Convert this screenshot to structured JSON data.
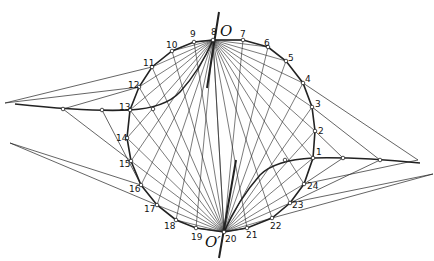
{
  "diagram": {
    "labels": {
      "top_pole": "O",
      "bottom_pole": "O′"
    },
    "points": [
      {
        "n": "1",
        "x": 313,
        "y": 158,
        "lx": 316,
        "ly": 155
      },
      {
        "n": "2",
        "x": 315,
        "y": 131,
        "lx": 318,
        "ly": 134
      },
      {
        "n": "3",
        "x": 312,
        "y": 107,
        "lx": 315,
        "ly": 107
      },
      {
        "n": "4",
        "x": 303,
        "y": 83,
        "lx": 305,
        "ly": 82
      },
      {
        "n": "5",
        "x": 286,
        "y": 61,
        "lx": 288,
        "ly": 61
      },
      {
        "n": "6",
        "x": 268,
        "y": 47,
        "lx": 264,
        "ly": 46
      },
      {
        "n": "7",
        "x": 243,
        "y": 40,
        "lx": 240,
        "ly": 37
      },
      {
        "n": "8",
        "x": 213,
        "y": 40,
        "lx": 211,
        "ly": 35
      },
      {
        "n": "9",
        "x": 194,
        "y": 42,
        "lx": 190,
        "ly": 37
      },
      {
        "n": "10",
        "x": 172,
        "y": 51,
        "lx": 166,
        "ly": 48
      },
      {
        "n": "11",
        "x": 152,
        "y": 67,
        "lx": 143,
        "ly": 66
      },
      {
        "n": "12",
        "x": 139,
        "y": 87,
        "lx": 128,
        "ly": 88
      },
      {
        "n": "13",
        "x": 130,
        "y": 110,
        "lx": 119,
        "ly": 110
      },
      {
        "n": "14",
        "x": 127,
        "y": 138,
        "lx": 116,
        "ly": 141
      },
      {
        "n": "15",
        "x": 131,
        "y": 161,
        "lx": 119,
        "ly": 167
      },
      {
        "n": "16",
        "x": 141,
        "y": 185,
        "lx": 129,
        "ly": 192
      },
      {
        "n": "17",
        "x": 157,
        "y": 205,
        "lx": 144,
        "ly": 212
      },
      {
        "n": "18",
        "x": 176,
        "y": 220,
        "lx": 164,
        "ly": 229
      },
      {
        "n": "19",
        "x": 196,
        "y": 228,
        "lx": 191,
        "ly": 240
      },
      {
        "n": "20",
        "x": 224,
        "y": 232,
        "lx": 225,
        "ly": 242
      },
      {
        "n": "21",
        "x": 247,
        "y": 228,
        "lx": 246,
        "ly": 238
      },
      {
        "n": "22",
        "x": 272,
        "y": 218,
        "lx": 270,
        "ly": 229
      },
      {
        "n": "23",
        "x": 290,
        "y": 203,
        "lx": 292,
        "ly": 208
      },
      {
        "n": "24",
        "x": 304,
        "y": 184,
        "lx": 307,
        "ly": 189
      }
    ],
    "pole_top": {
      "x": 213,
      "y": 40
    },
    "pole_bottom": {
      "x": 224,
      "y": 232
    },
    "stroke_color": "#222222"
  }
}
